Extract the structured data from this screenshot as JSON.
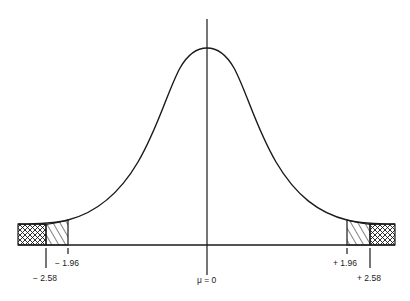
{
  "diagram": {
    "colors": {
      "ink": "#1a1a1a",
      "background": "#ffffff"
    },
    "mean_label": "μ = 0",
    "critical_values": [
      {
        "id": "neg-2-58",
        "label": "− 2.58",
        "z": -2.58,
        "tick": "long"
      },
      {
        "id": "neg-1-96",
        "label": "− 1.96",
        "z": -1.96,
        "tick": "short"
      },
      {
        "id": "pos-1-96",
        "label": "+ 1.96",
        "z": 1.96,
        "tick": "short"
      },
      {
        "id": "pos-2-58",
        "label": "+ 2.58",
        "z": 2.58,
        "tick": "long"
      }
    ],
    "regions": [
      {
        "id": "left-outer-tail",
        "fill": "crosshatch",
        "from_z": "-inf",
        "to_z": -2.58
      },
      {
        "id": "left-inner-tail",
        "fill": "diagonal-hatch",
        "from_z": -2.58,
        "to_z": -1.96
      },
      {
        "id": "right-inner-tail",
        "fill": "diagonal-hatch",
        "from_z": 1.96,
        "to_z": 2.58
      },
      {
        "id": "right-outer-tail",
        "fill": "crosshatch",
        "from_z": 2.58,
        "to_z": "inf"
      }
    ]
  }
}
